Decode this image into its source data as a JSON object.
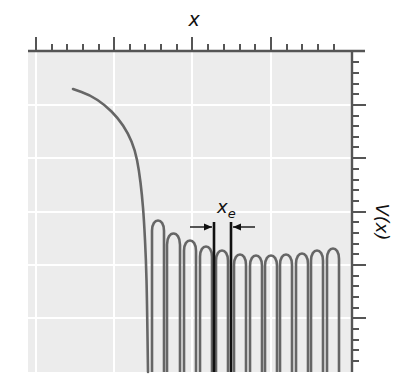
{
  "chart_data": {
    "type": "line",
    "title": "",
    "xlabel": "x",
    "ylabel": "V(x)",
    "annotation": "x_e",
    "annotation_main": "x",
    "annotation_sub": "e",
    "grid": true,
    "colors": {
      "plot_bg": "#ececec",
      "grid": "#ffffff",
      "axis": "#555555",
      "curve": "#666666",
      "marker": "#111111"
    },
    "plot_box": {
      "left": 28,
      "top": 51,
      "right": 352,
      "bottom": 372
    },
    "top_axis": {
      "y": 51,
      "x_start": 28,
      "x_end": 365,
      "major_ticks": [
        36,
        114,
        192,
        271
      ],
      "minor_ticks": [
        52,
        67,
        83,
        99,
        130,
        145,
        161,
        177,
        208,
        224,
        240,
        255,
        287,
        302,
        318,
        334
      ]
    },
    "right_axis": {
      "x": 352,
      "y_start": 51,
      "y_end": 372,
      "major_ticks": [
        105,
        158,
        212,
        265,
        318
      ],
      "minor_ticks": [
        62,
        73,
        84,
        94,
        116,
        126,
        137,
        147,
        169,
        180,
        190,
        201,
        222,
        233,
        244,
        254,
        276,
        286,
        297,
        308,
        329,
        340,
        350,
        361
      ]
    },
    "gridlines": {
      "vertical": [
        36,
        114,
        192,
        271
      ],
      "horizontal": [
        105,
        158,
        212,
        265,
        318
      ]
    },
    "descending_curve": [
      [
        73,
        89
      ],
      [
        90,
        95
      ],
      [
        105,
        105
      ],
      [
        118,
        118
      ],
      [
        128,
        133
      ],
      [
        135,
        150
      ],
      [
        139,
        170
      ],
      [
        142,
        195
      ],
      [
        144,
        220
      ],
      [
        146,
        260
      ],
      [
        147,
        300
      ],
      [
        148,
        372
      ]
    ],
    "arches": [
      {
        "left": 152,
        "right": 164,
        "peak_y": 220
      },
      {
        "left": 167,
        "right": 180,
        "peak_y": 233
      },
      {
        "left": 184,
        "right": 196,
        "peak_y": 240
      },
      {
        "left": 200,
        "right": 212,
        "peak_y": 246
      },
      {
        "left": 216,
        "right": 228,
        "peak_y": 250
      },
      {
        "left": 234,
        "right": 246,
        "peak_y": 254
      },
      {
        "left": 250,
        "right": 262,
        "peak_y": 255
      },
      {
        "left": 265,
        "right": 277,
        "peak_y": 255
      },
      {
        "left": 280,
        "right": 292,
        "peak_y": 254
      },
      {
        "left": 296,
        "right": 308,
        "peak_y": 253
      },
      {
        "left": 311,
        "right": 323,
        "peak_y": 250
      },
      {
        "left": 327,
        "right": 339,
        "peak_y": 248
      }
    ],
    "arch_bottom": 372,
    "markers": [
      {
        "x": 214,
        "top": 222,
        "bottom": 372
      },
      {
        "x": 231,
        "top": 222,
        "bottom": 372
      }
    ],
    "arrows": [
      {
        "x1": 190,
        "x2": 212,
        "y": 227
      },
      {
        "x1": 255,
        "x2": 233,
        "y": 227
      }
    ],
    "label_positions": {
      "xlabel": {
        "x": 194,
        "y": 26
      },
      "ylabel": {
        "x": 376,
        "y": 222
      },
      "annotation": {
        "x": 217,
        "y": 213
      }
    }
  }
}
